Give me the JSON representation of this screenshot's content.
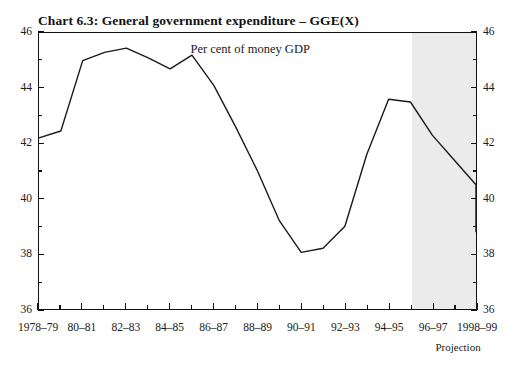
{
  "chart_data": {
    "type": "line",
    "title": "Chart 6.3: General government expenditure – GGE(X)",
    "subtitle": "Per cent of money GDP",
    "xlabel": "",
    "ylabel": "",
    "ylim": [
      36,
      46
    ],
    "y_ticks_major": [
      36,
      38,
      40,
      42,
      44,
      46
    ],
    "y_ticks_minor": [
      37,
      39,
      41,
      43,
      45
    ],
    "y_tick_labels": [
      "36",
      "38",
      "40",
      "42",
      "44",
      "46"
    ],
    "y_axis_both_sides": true,
    "grid": false,
    "legend": false,
    "categories": [
      "1978–79",
      "1979–80",
      "1980–81",
      "1981–82",
      "1982–83",
      "1983–84",
      "1984–85",
      "1985–86",
      "1986–87",
      "1987–88",
      "1988–89",
      "1989–90",
      "1990–91",
      "1991–92",
      "1992–93",
      "1993–94",
      "1994–95",
      "1995–96",
      "1996–97",
      "1997–98",
      "1998–99"
    ],
    "x_tick_labels": [
      "1978–79",
      "80–81",
      "82–83",
      "84–85",
      "86–87",
      "88–89",
      "90–91",
      "92–93",
      "94–95",
      "96–97",
      "1998–99"
    ],
    "values": [
      42.2,
      42.45,
      45.0,
      45.3,
      45.45,
      45.1,
      44.7,
      45.2,
      44.1,
      42.6,
      41.0,
      39.2,
      38.05,
      38.2,
      39.0,
      41.6,
      43.6,
      43.5,
      42.3,
      41.4,
      40.5
    ],
    "values_tail": 38.8,
    "annotations": [
      {
        "text": "Projection",
        "start_category": "1995–96"
      }
    ],
    "projection_label": "Projection",
    "projection_band_start_index": 17,
    "line_color": "#1a1a1a",
    "projection_band_color": "#ebebeb",
    "background_color": "#ffffff"
  }
}
